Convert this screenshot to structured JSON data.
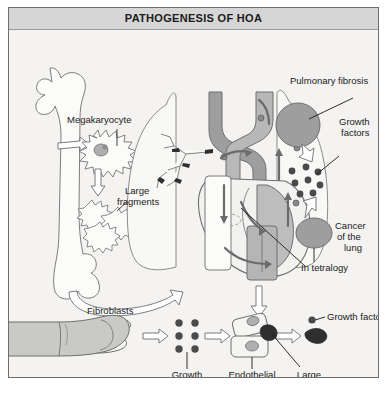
{
  "panel": {
    "title": "PATHOGENESIS OF HOA"
  },
  "colors": {
    "page_background": "#ffffff",
    "panel_background": "#f3f2f0",
    "titlebar_background": "#d6d6d6",
    "panel_border": "#6e6e6e",
    "text": "#1a1a1a",
    "vessel_gray": "#9a9a9a",
    "organ_fill": "#f7f7f5",
    "mass_fill": "#9e9e9e",
    "nucleus_fill": "#b0b0b0",
    "dot_dark": "#4a4a4a",
    "flow_arrow": "#6b6b6b",
    "outline": "#6e6e6e"
  },
  "labels": {
    "megakaryocyte": "Megakaryocyte",
    "large_fragments_1": "Large",
    "large_fragments_2": "fragments",
    "pulmonary_fibrosis": "Pulmonary fibrosis",
    "growth_factors_right_1": "Growth",
    "growth_factors_right_2": "factors",
    "cancer_lung_1": "Cancer",
    "cancer_lung_2": "of the",
    "cancer_lung_3": "lung",
    "in_tetralogy": "In tetralogy",
    "growth_factor_single": "Growth factor",
    "fibroblasts": "Fibroblasts",
    "growth_factors_bottom_1": "Growth",
    "growth_factors_bottom_2": "factors",
    "endothelial_cell_1": "Endothelial",
    "endothelial_cell_2": "cell",
    "large_platelet_1": "Large",
    "large_platelet_2": "platelet",
    "finger_clubbing": "Finger clubbing"
  },
  "icons": {
    "femur": "femur-bone-icon",
    "megakaryocyte": "megakaryocyte-cell-icon",
    "fragments": "platelet-fragments-icon",
    "lung_left": "left-lung-icon",
    "lung_right": "right-lung-icon",
    "bronchial_tree": "bronchial-tree-icon",
    "heart": "heart-icon",
    "fibrosis_mass": "pulmonary-fibrosis-mass-icon",
    "tumour_mass": "lung-cancer-mass-icon",
    "growth_factor_dots": "growth-factor-dots-icon",
    "hollow_arrow": "hollow-arrow-icon",
    "flow_arrow": "blood-flow-arrow-icon",
    "fibroblast": "fibroblast-cell-icon",
    "endothelial": "endothelial-cell-icon",
    "platelet": "large-platelet-icon",
    "finger": "clubbed-finger-icon"
  }
}
